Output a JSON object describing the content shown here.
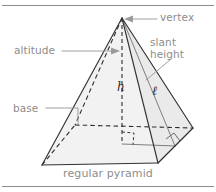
{
  "figure": {
    "caption": "regular pyramid",
    "shape_name": "square pyramid",
    "labels": {
      "vertex": "vertex",
      "altitude": "altitude",
      "slant_height_line1": "slant",
      "slant_height_line2": "height",
      "base": "base",
      "altitude_symbol": "h",
      "slant_height_symbol": "ℓ"
    },
    "colors": {
      "label_text": "#8d8d8d",
      "caption_text": "#8d8d8d",
      "math_text": "#2b2b2b",
      "edge_solid": "#333333",
      "edge_hidden_dashed": "#2e2e2e",
      "leader_line": "#9a9a9a",
      "rule": "#8e8e8e",
      "face_front_left": "#f2f2f2",
      "face_front_right": "#eaeaea",
      "face_base_left": "#e6e6e6",
      "face_base_right": "#dedede",
      "background": "#ffffff"
    },
    "annotations": [
      {
        "name": "vertex",
        "text": "vertex",
        "points_to": "apex",
        "marker": "arrow"
      },
      {
        "name": "altitude",
        "text": "altitude",
        "points_to": "altitude-line",
        "marker": "arrow"
      },
      {
        "name": "slant-height",
        "text": "slant height",
        "points_to": "slant-height-line",
        "marker": "line"
      },
      {
        "name": "base",
        "text": "base",
        "points_to": "base-face",
        "marker": "line"
      }
    ],
    "right_angle_markers": [
      {
        "name": "altitude-base-right-angle",
        "style": "dashed"
      },
      {
        "name": "slant-height-base-right-angle",
        "style": "solid"
      }
    ]
  }
}
